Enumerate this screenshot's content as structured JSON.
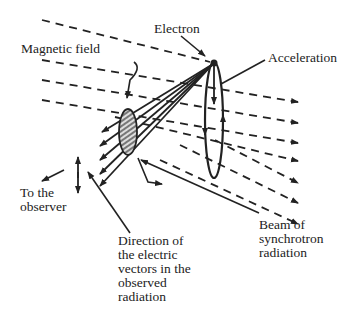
{
  "labels": {
    "electron": "Electron",
    "magnetic_field": "Magnetic field",
    "acceleration": "Acceleration",
    "to_observer_1": "To the",
    "to_observer_2": "observer",
    "beam_1": "Beam of",
    "beam_2": "synchrotron",
    "beam_3": "radiation",
    "direction_1": "Direction of",
    "direction_2": "the electric",
    "direction_3": "vectors in the",
    "direction_4": "observed",
    "direction_5": "radiation"
  },
  "colors": {
    "ink": "#222222",
    "hatch_fill": "#888888",
    "background": "#ffffff"
  }
}
